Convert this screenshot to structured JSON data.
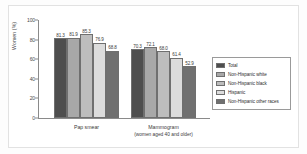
{
  "chart_data": {
    "type": "bar",
    "title": "",
    "subtitle": "",
    "xlabel": "",
    "ylabel": "Women (%)",
    "ylim": [
      0,
      100
    ],
    "yticks": [
      0,
      20,
      40,
      60,
      80,
      100
    ],
    "ytick_labels": [
      "0",
      "20",
      "40",
      "60",
      "80",
      "100"
    ],
    "grid": false,
    "legend_position": "right",
    "categories": [
      "Pap smear",
      "Mammogram"
    ],
    "category_labels": [
      {
        "line1": "Pap smear",
        "line2": ""
      },
      {
        "line1": "Mammogram",
        "line2": "(women aged 40 and older)"
      }
    ],
    "series": [
      {
        "name": "Total",
        "color": "#4e4e4e",
        "values": [
          81.3,
          70.3
        ]
      },
      {
        "name": "Non-Hispanic white",
        "color": "#a8a8a8",
        "values": [
          81.9,
          72.1
        ]
      },
      {
        "name": "Non-Hispanic black",
        "color": "#bdbdbd",
        "values": [
          85.3,
          68.0
        ]
      },
      {
        "name": "Hispanic",
        "color": "#dcdcdc",
        "values": [
          76.9,
          61.4
        ]
      },
      {
        "name": "Non-Hispanic other races",
        "color": "#707070",
        "values": [
          68.8,
          52.9
        ]
      }
    ],
    "value_labels": {
      "pap_smear": [
        "81.3",
        "81.9",
        "85.3",
        "76.9",
        "68.8"
      ],
      "mammogram": [
        "70.3",
        "72.1",
        "68.0",
        "61.4",
        "52.9"
      ]
    }
  },
  "legend": {
    "items": [
      {
        "label": "Total"
      },
      {
        "label": "Non-Hispanic white"
      },
      {
        "label": "Non-Hispanic black"
      },
      {
        "label": "Hispanic"
      },
      {
        "label": "Non-Hispanic other races"
      }
    ]
  },
  "axes": {
    "y_title": "Women (%)"
  }
}
